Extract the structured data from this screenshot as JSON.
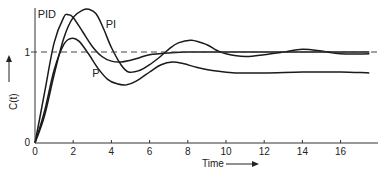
{
  "chart_data": {
    "type": "line",
    "title": "",
    "xlabel": "Time",
    "ylabel": "C(t)",
    "xlim": [
      0,
      18
    ],
    "ylim": [
      0,
      1.55
    ],
    "x_ticks": [
      0,
      2,
      4,
      6,
      8,
      10,
      12,
      14,
      16
    ],
    "y_ticks": [
      0,
      1
    ],
    "grid": false,
    "legend": "inline-labels",
    "reference_line": {
      "y": 1,
      "style": "dashed"
    },
    "series": [
      {
        "name": "PID",
        "x": [
          0,
          0.5,
          1.0,
          1.5,
          1.75,
          2.0,
          2.5,
          3.0,
          3.5,
          4.0,
          4.5,
          5.0,
          5.5,
          6.0,
          7.0,
          8.0,
          10.0,
          12.0,
          14.0,
          16.0,
          17.5
        ],
        "y": [
          0,
          0.55,
          1.1,
          1.38,
          1.41,
          1.38,
          1.22,
          1.06,
          0.95,
          0.9,
          0.89,
          0.91,
          0.94,
          0.97,
          0.99,
          1.0,
          1.0,
          1.0,
          1.0,
          1.0,
          1.0
        ]
      },
      {
        "name": "PI",
        "x": [
          0,
          0.5,
          1.0,
          1.5,
          2.0,
          2.5,
          2.8,
          3.2,
          3.6,
          4.0,
          4.5,
          4.9,
          5.5,
          6.0,
          6.5,
          7.0,
          7.5,
          8.2,
          9.0,
          9.5,
          10.0,
          11.0,
          12.0,
          13.0,
          14.0,
          15.0,
          16.0,
          17.5
        ],
        "y": [
          0,
          0.3,
          0.75,
          1.15,
          1.38,
          1.46,
          1.47,
          1.42,
          1.25,
          1.05,
          0.86,
          0.78,
          0.8,
          0.86,
          0.94,
          1.03,
          1.1,
          1.13,
          1.08,
          1.02,
          0.98,
          0.95,
          0.97,
          1.0,
          1.03,
          1.01,
          0.98,
          0.98
        ]
      },
      {
        "name": "P",
        "x": [
          0,
          0.5,
          1.0,
          1.5,
          1.9,
          2.3,
          2.8,
          3.3,
          3.8,
          4.3,
          4.8,
          5.3,
          6.0,
          6.6,
          7.2,
          7.8,
          8.5,
          9.5,
          10.5,
          12.0,
          14.0,
          16.0,
          17.5
        ],
        "y": [
          0,
          0.35,
          0.8,
          1.08,
          1.15,
          1.12,
          0.98,
          0.82,
          0.7,
          0.65,
          0.64,
          0.68,
          0.78,
          0.86,
          0.89,
          0.87,
          0.83,
          0.79,
          0.77,
          0.77,
          0.78,
          0.78,
          0.77
        ]
      }
    ]
  }
}
